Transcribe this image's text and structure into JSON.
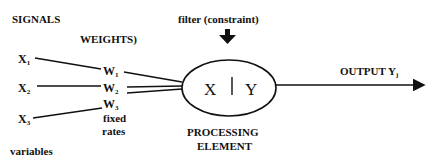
{
  "diagram": {
    "labels": {
      "signals": "SIGNALS",
      "weights": "WEIGHTS)",
      "filter": "filter (constraint)",
      "fixed": "fixed",
      "rates": "rates",
      "variables": "variables",
      "processing": "PROCESSING",
      "element": "ELEMENT",
      "output": "OUTPUT Y",
      "output_sub": "j"
    },
    "inputs": [
      {
        "name": "X",
        "sub": "1"
      },
      {
        "name": "X",
        "sub": "2"
      },
      {
        "name": "X",
        "sub": "3"
      }
    ],
    "weights": [
      {
        "name": "W",
        "sub": "1"
      },
      {
        "name": "W",
        "sub": "2"
      },
      {
        "name": "W",
        "sub": "3"
      }
    ],
    "node": {
      "left": "X",
      "right": "Y"
    },
    "colors": {
      "ink": "#111111",
      "background": "#ffffff"
    }
  }
}
